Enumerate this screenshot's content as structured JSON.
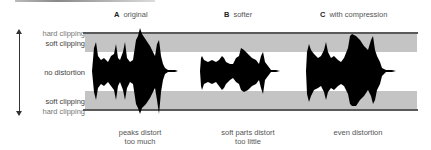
{
  "diagram": {
    "headings": [
      {
        "letter": "A",
        "text": "original"
      },
      {
        "letter": "B",
        "text": "softer"
      },
      {
        "letter": "C",
        "text": "with compression"
      }
    ],
    "levels": {
      "hard_top": "hard clipping",
      "soft_top": "soft clipping",
      "middle": "no distortion",
      "soft_bottom": "soft clipping",
      "hard_bottom": "hard clipping"
    },
    "captions": [
      {
        "line1": "peaks distort",
        "line2": "too much"
      },
      {
        "line1": "soft parts distort",
        "line2": "too little"
      },
      {
        "line1": "even distortion",
        "line2": ""
      }
    ],
    "colors": {
      "band": "#c4c4c4",
      "clip_line": "#5a5a5a",
      "waveform": "#000000"
    }
  }
}
